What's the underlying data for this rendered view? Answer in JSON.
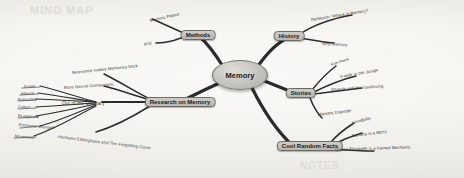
{
  "diagram": {
    "type": "mind-map",
    "title": "Memory",
    "background_color": "#f2f1ec",
    "node_color": "#c4c2bc",
    "stroke_color": "#2b2b2b",
    "center": {
      "label": "Memory"
    },
    "branches": [
      {
        "label": "Methods",
        "children": [
          {
            "label": "Memory Palace"
          },
          {
            "label": "grid"
          }
        ]
      },
      {
        "label": "History",
        "children": [
          {
            "label": "Research, Where is Memory?"
          },
          {
            "label": "Why Memory"
          }
        ]
      },
      {
        "label": "Stories",
        "children": [
          {
            "label": "Kim Peek"
          },
          {
            "label": "A walk in the Jungle"
          },
          {
            "label": "Shaesh and his Taxidriving"
          },
          {
            "label": "Memory Disorder"
          }
        ]
      },
      {
        "label": "Cool Random Facts",
        "children": [
          {
            "label": "LoveBaby"
          },
          {
            "label": "Banana is a Berry"
          },
          {
            "label": "Queen Elizabeth is a trained Mechanic"
          }
        ]
      },
      {
        "label": "Research on Memory",
        "children": [
          {
            "label": "Relevance makes Memories Stick"
          },
          {
            "label": "More Neural Connections"
          },
          {
            "label": "Hermann Ebbinghaus and The Forgetting Curve"
          },
          {
            "label": "Emotional Charged"
          }
        ]
      },
      {
        "label": "Out of the Ordinary",
        "children": [
          {
            "label": "Funny"
          },
          {
            "label": "Absurd"
          },
          {
            "label": "Ridiculous"
          },
          {
            "label": "Colour"
          },
          {
            "label": "Exaggerate"
          },
          {
            "label": "Emotional Charged"
          },
          {
            "label": "Movement"
          }
        ]
      }
    ],
    "watermark": [
      {
        "text": "MIND MAP"
      },
      {
        "text": "NOTES"
      }
    ]
  }
}
